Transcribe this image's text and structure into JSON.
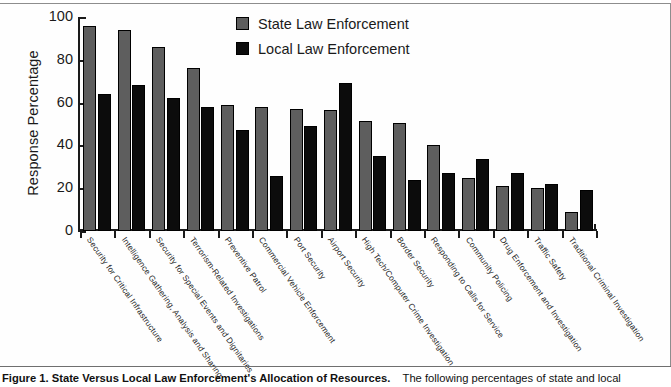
{
  "figure": {
    "caption_bold": "Figure 1.  State Versus Local Law Enforcement's Allocation of Resources.",
    "caption_body": "The following percentages of state and local"
  },
  "legend": {
    "items": [
      {
        "label": "State Law Enforcement",
        "color": "#5e5e5e"
      },
      {
        "label": "Local Law Enforcement",
        "color": "#0c0c0c"
      }
    ]
  },
  "axes": {
    "y_title": "Response Percentage",
    "y_ticks": [
      "0",
      "20",
      "40",
      "60",
      "80",
      "100"
    ]
  },
  "chart_data": {
    "type": "bar",
    "title": "State Versus Local Law Enforcement's Allocation of Resources",
    "xlabel": "",
    "ylabel": "Response Percentage",
    "ylim": [
      0,
      100
    ],
    "grid": false,
    "legend_position": "top-center",
    "categories": [
      "Security for Critical Infrastructure",
      "Intelligence Gathering, Analysis and Sharing",
      "Security for Special Events and Dignitaries",
      "Terrorism-Related Investigations",
      "Preventive Patrol",
      "Commercial Vehicle Enforcement",
      "Port Security",
      "Airport Security",
      "High Tech/Computer Crime Investigation",
      "Border Security",
      "Responding to Calls for Service",
      "Community Policing",
      "Drug Enforcement and Investigation",
      "Traffic Safety",
      "Traditional Criminal Investigation"
    ],
    "series": [
      {
        "name": "State Law Enforcement",
        "color": "#5e5e5e",
        "values": [
          96,
          94,
          86,
          76,
          59,
          58,
          57,
          56.5,
          51.5,
          50.5,
          40,
          25,
          21,
          20,
          9
        ]
      },
      {
        "name": "Local Law Enforcement",
        "color": "#0c0c0c",
        "values": [
          64,
          68,
          62,
          58,
          47,
          25.5,
          49,
          69,
          35,
          24,
          27,
          33.5,
          27,
          22,
          19
        ]
      }
    ]
  }
}
